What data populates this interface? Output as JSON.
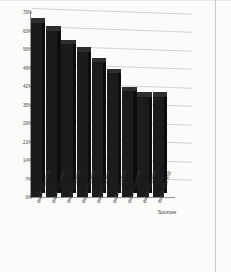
{
  "chart_data": {
    "type": "bar",
    "title": "",
    "subtitle": "",
    "xlabel": "Sources",
    "ylabel": "",
    "categories": [
      "BMCE 2008 RSE",
      "BMCE 2007 RSE",
      "BMCE 2015 RSE",
      "BMCE 2014 RSE",
      "BMCE 2012 RSE",
      "BMCE 2013 RSE",
      "BMCE 2009 RSE",
      "BMCE 2010 RSE",
      "BMCE 2011 RSE"
    ],
    "values": [
      66,
      63,
      58,
      55,
      51,
      47,
      40,
      38,
      38
    ],
    "ylim": [
      0,
      70
    ],
    "yticks": [
      0,
      7,
      14,
      21,
      28,
      35,
      42,
      49,
      56,
      63,
      70
    ],
    "ytick_labels": [
      "0%",
      "7%",
      "14%",
      "21%",
      "28%",
      "35%",
      "42%",
      "49%",
      "56%",
      "63%",
      "70%"
    ],
    "grid": true,
    "legend": false,
    "legend_position": "none",
    "style": "3d-column",
    "bar_color": "#1b1b1b",
    "grid_color": "#d2d2d2",
    "axis_color": "#9a9a9a"
  }
}
